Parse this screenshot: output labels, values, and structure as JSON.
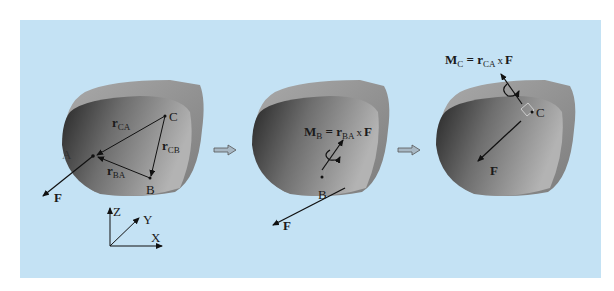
{
  "figure": {
    "background_color": "#c4e2f4",
    "body_color_dark": "#2f2f2f",
    "body_color_light": "#b8b8b8",
    "panels": [
      {
        "id": "panel-1",
        "points": {
          "A": "A",
          "B": "B",
          "C": "C"
        },
        "vectors": {
          "r_CA": {
            "base": "r",
            "sub": "CA"
          },
          "r_CB": {
            "base": "r",
            "sub": "CB"
          },
          "r_BA": {
            "base": "r",
            "sub": "BA"
          }
        },
        "force": "F",
        "axes": {
          "z": "Z",
          "y": "Y",
          "x": "X"
        }
      },
      {
        "id": "panel-2",
        "point": "B",
        "force": "F",
        "equation": {
          "lhs": "M",
          "lhs_sub": "B",
          "eq": " = ",
          "r": "r",
          "r_sub": "BA",
          "cross": "x",
          "F": "F"
        }
      },
      {
        "id": "panel-3",
        "point": "C",
        "force": "F",
        "equation": {
          "lhs": "M",
          "lhs_sub": "C",
          "eq": " = ",
          "r": "r",
          "r_sub": "CA",
          "cross": "x",
          "F": "F"
        }
      }
    ],
    "transition_arrows": [
      "right-arrow",
      "right-arrow"
    ]
  }
}
